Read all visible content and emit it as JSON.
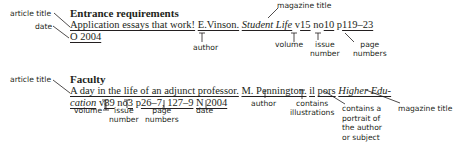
{
  "entry1": {
    "heading": "Entrance requirements",
    "line1": {
      "article_title": "Application essays that work!",
      "author": "E.Vinson.",
      "magazine_title": "Student Life",
      "v_prefix": "v",
      "volume": "15",
      "no_prefix": "no",
      "issue": "10",
      "p_prefix": "p",
      "pages": "119–23"
    },
    "line2": {
      "date": "O 2004"
    },
    "labels": {
      "article_title": "article title",
      "date": "date",
      "author": "author",
      "magazine_title": "magazine title",
      "volume": "volume",
      "issue": "issue\nnumber",
      "issue_l1": "issue",
      "issue_l2": "number",
      "pages_l1": "page",
      "pages_l2": "numbers"
    }
  },
  "entry2": {
    "heading": "Faculty",
    "line1": {
      "article_title": "A day in the life of an adjunct professor.",
      "author": "M. Pennington.",
      "illustrations": "il",
      "portraits": "pors",
      "magazine_title_part1": "Higher Edu-"
    },
    "line2": {
      "magazine_title_part2": "cation",
      "v_prefix": "v",
      "volume": "89",
      "no_prefix": "no",
      "issue": "3",
      "p_prefix": "p",
      "pages": "26–7, 127–9",
      "date": "N 2004"
    },
    "labels": {
      "article_title": "article title",
      "author": "author",
      "illustrations_l1": "contains",
      "illustrations_l2": "illustrations",
      "portraits_l1": "contains a",
      "portraits_l2": "portrait of",
      "portraits_l3": "the author",
      "portraits_l4": "or subject",
      "magazine_title": "magazine title",
      "volume": "volume",
      "issue_l1": "issue",
      "issue_l2": "number",
      "pages_l1": "page",
      "pages_l2": "numbers",
      "date": "date"
    }
  }
}
